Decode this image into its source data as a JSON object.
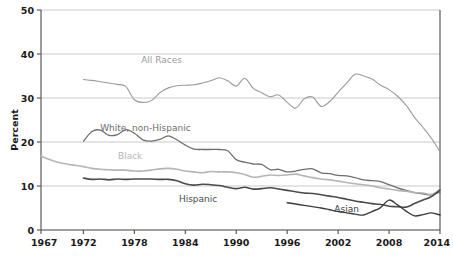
{
  "chart_data": {
    "type": "line",
    "title": "",
    "xlabel": "",
    "ylabel": "Percent",
    "xlim": [
      1967,
      2014
    ],
    "ylim": [
      0,
      50
    ],
    "grid": true,
    "legend_position": "inline-annotations",
    "y_ticks": [
      "0",
      "10",
      "20",
      "30",
      "40",
      "50"
    ],
    "y_tick_values": [
      0,
      10,
      20,
      30,
      40,
      50
    ],
    "x_ticks": [
      "1967",
      "1972",
      "1978",
      "1984",
      "1990",
      "1996",
      "2002",
      "2008",
      "2014"
    ],
    "x_tick_values": [
      1967,
      1972,
      1978,
      1984,
      1990,
      1996,
      2002,
      2008,
      2014
    ],
    "series": [
      {
        "name": "All Races",
        "color": "#9a9a9a",
        "width": 1.1,
        "label_x": 1981.2,
        "label_y": 38.0,
        "x": [
          1972,
          1973,
          1974,
          1975,
          1976,
          1977,
          1978,
          1979,
          1980,
          1981,
          1982,
          1983,
          1984,
          1985,
          1986,
          1987,
          1988,
          1989,
          1990,
          1991,
          1992,
          1993,
          1994,
          1995,
          1996,
          1997,
          1998,
          1999,
          2000,
          2001,
          2002,
          2003,
          2004,
          2005,
          2006,
          2007,
          2008,
          2009,
          2010,
          2011,
          2012,
          2013,
          2014
        ],
        "values": [
          34.2,
          34.0,
          33.7,
          33.4,
          33.1,
          32.6,
          29.6,
          29.0,
          29.4,
          31.2,
          32.3,
          32.8,
          32.9,
          33.0,
          33.4,
          33.9,
          34.6,
          33.9,
          32.7,
          34.5,
          32.2,
          31.2,
          30.3,
          30.7,
          29.0,
          27.7,
          29.8,
          30.2,
          28.1,
          29.2,
          31.3,
          33.4,
          35.4,
          35.0,
          34.3,
          32.9,
          31.9,
          30.4,
          28.4,
          25.6,
          23.3,
          20.8,
          17.8
        ]
      },
      {
        "name": "White, non-Hispanic",
        "color": "#6e6e6e",
        "width": 1.3,
        "label_x": 1979.3,
        "label_y": 22.6,
        "x": [
          1972,
          1973,
          1974,
          1975,
          1976,
          1977,
          1978,
          1979,
          1980,
          1981,
          1982,
          1983,
          1984,
          1985,
          1986,
          1987,
          1988,
          1989,
          1990,
          1991,
          1992,
          1993,
          1994,
          1995,
          1996,
          1997,
          1998,
          1999,
          2000,
          2001,
          2002,
          2003,
          2004,
          2005,
          2006,
          2007,
          2008,
          2009,
          2010,
          2011,
          2012,
          2013,
          2014
        ],
        "values": [
          20.2,
          22.4,
          22.7,
          21.5,
          21.7,
          22.8,
          22.0,
          20.5,
          20.2,
          20.6,
          21.4,
          20.5,
          19.3,
          18.4,
          18.3,
          18.3,
          18.3,
          18.0,
          16.0,
          15.4,
          15.0,
          14.9,
          13.7,
          13.8,
          13.2,
          13.4,
          13.8,
          13.9,
          13.0,
          12.8,
          12.4,
          12.3,
          11.9,
          11.4,
          11.2,
          11.0,
          10.3,
          9.6,
          9.0,
          8.5,
          8.2,
          8.0,
          8.6
        ]
      },
      {
        "name": "Black",
        "color": "#b5b5b5",
        "width": 1.6,
        "label_x": 1977.5,
        "label_y": 16.1,
        "x": [
          1967,
          1968,
          1969,
          1970,
          1971,
          1972,
          1973,
          1974,
          1975,
          1976,
          1977,
          1978,
          1979,
          1980,
          1981,
          1982,
          1983,
          1984,
          1985,
          1986,
          1987,
          1988,
          1989,
          1990,
          1991,
          1992,
          1993,
          1994,
          1995,
          1996,
          1997,
          1998,
          1999,
          2000,
          2001,
          2002,
          2003,
          2004,
          2005,
          2006,
          2007,
          2008,
          2009,
          2010,
          2011,
          2012,
          2013,
          2014
        ],
        "values": [
          16.8,
          16.0,
          15.4,
          15.0,
          14.7,
          14.4,
          14.0,
          13.8,
          13.7,
          13.6,
          13.6,
          13.4,
          13.4,
          13.6,
          13.9,
          14.0,
          13.8,
          13.4,
          13.2,
          13.0,
          13.3,
          13.2,
          13.2,
          13.0,
          12.6,
          12.0,
          12.2,
          12.5,
          12.4,
          12.5,
          12.7,
          12.3,
          11.9,
          11.6,
          11.4,
          11.1,
          10.8,
          10.5,
          10.3,
          10.0,
          9.6,
          9.3,
          9.0,
          8.8,
          8.5,
          8.4,
          8.1,
          9.2
        ]
      },
      {
        "name": "Hispanic",
        "color": "#4a4a4a",
        "width": 1.6,
        "label_x": 1985.5,
        "label_y": 6.4,
        "x": [
          1972,
          1973,
          1974,
          1975,
          1976,
          1977,
          1978,
          1979,
          1980,
          1981,
          1982,
          1983,
          1984,
          1985,
          1986,
          1987,
          1988,
          1989,
          1990,
          1991,
          1992,
          1993,
          1994,
          1995,
          1996,
          1997,
          1998,
          1999,
          2000,
          2001,
          2002,
          2003,
          2004,
          2005,
          2006,
          2007,
          2008,
          2009,
          2010,
          2011,
          2012,
          2013,
          2014
        ],
        "values": [
          11.8,
          11.5,
          11.6,
          11.4,
          11.6,
          11.5,
          11.6,
          11.6,
          11.6,
          11.5,
          11.5,
          11.2,
          10.5,
          10.2,
          10.4,
          10.3,
          10.1,
          9.7,
          9.4,
          9.7,
          9.3,
          9.4,
          9.6,
          9.3,
          9.0,
          8.7,
          8.4,
          8.3,
          8.0,
          7.7,
          7.4,
          7.0,
          6.6,
          6.3,
          6.0,
          5.8,
          5.4,
          5.3,
          5.2,
          6.0,
          6.8,
          7.6,
          9.1
        ]
      },
      {
        "name": "Asian",
        "color": "#3c3c3c",
        "width": 1.4,
        "label_x": 2003.0,
        "label_y": 4.2,
        "x": [
          1996,
          1997,
          1998,
          1999,
          2000,
          2001,
          2002,
          2003,
          2004,
          2005,
          2006,
          2007,
          2008,
          2009,
          2010,
          2011,
          2012,
          2013,
          2014
        ],
        "values": [
          6.2,
          5.9,
          5.6,
          5.3,
          5.0,
          4.6,
          4.2,
          3.9,
          3.6,
          3.4,
          4.2,
          5.1,
          6.8,
          5.7,
          4.3,
          3.2,
          3.5,
          3.9,
          3.4
        ]
      }
    ],
    "annotations": [
      {
        "name": "all-races-label",
        "text": "All Races"
      },
      {
        "name": "white-non-hispanic-label",
        "text": "White, non-Hispanic"
      },
      {
        "name": "black-label",
        "text": "Black"
      },
      {
        "name": "hispanic-label",
        "text": "Hispanic"
      },
      {
        "name": "asian-label",
        "text": "Asian"
      }
    ]
  },
  "axis": {
    "y_title": "Percent"
  },
  "colors": {
    "grid": "#c9c9c9",
    "axis": "#5a5a5a",
    "text": "#1a1a1a",
    "background": "#ffffff"
  }
}
